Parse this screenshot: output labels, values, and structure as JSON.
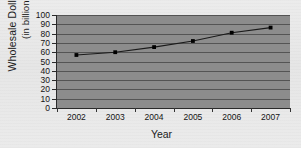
{
  "chart_data": {
    "type": "line",
    "title": "",
    "xlabel": "Year",
    "ylabel": "Wholesale Dollar Value (in billions)",
    "ylabel_line1": "Wholesale Dollar Value",
    "ylabel_line2": "(in billions)",
    "categories": [
      "2002",
      "2003",
      "2004",
      "2005",
      "2006",
      "2007"
    ],
    "values": [
      57,
      60,
      65.5,
      72,
      81,
      86.5
    ],
    "ytick_labels": [
      "100",
      "90",
      "80",
      "70",
      "60",
      "50",
      "40",
      "30",
      "20",
      "10",
      "0"
    ],
    "ytick_values": [
      100,
      90,
      80,
      70,
      60,
      50,
      40,
      30,
      20,
      10,
      0
    ],
    "ylim": [
      0,
      100
    ],
    "ytick_step": 10,
    "grid": true,
    "legend": false,
    "marker": "square",
    "colors": {
      "plot_background": "#8c8c8c",
      "gridline": "#4a4a4a",
      "axis": "#2a2a2a",
      "series_line": "#1a1a1a",
      "marker": "#000000",
      "page_background": "#ececec",
      "text": "#141414"
    }
  }
}
